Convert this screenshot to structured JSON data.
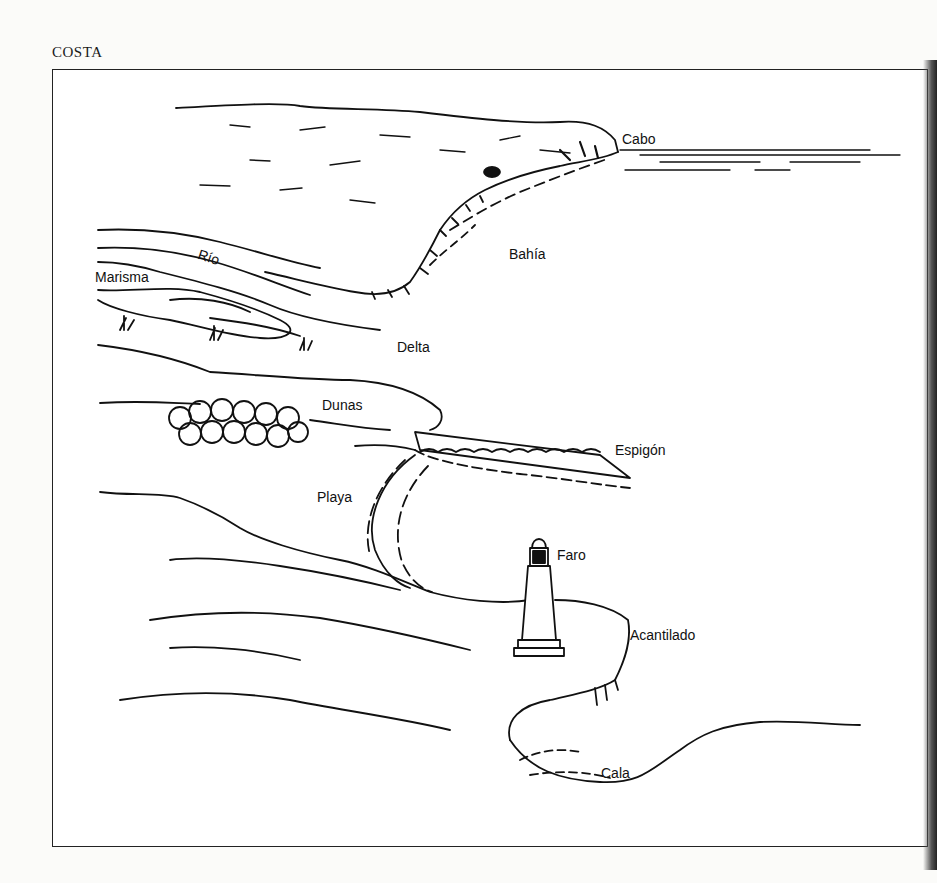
{
  "page": {
    "title": "COSTA"
  },
  "diagram": {
    "labels": [
      {
        "id": "cabo",
        "text": "Cabo",
        "x": 622,
        "y": 132
      },
      {
        "id": "bahia",
        "text": "Bahía",
        "x": 509,
        "y": 247
      },
      {
        "id": "rio",
        "text": "Río",
        "x": 198,
        "y": 250
      },
      {
        "id": "marisma",
        "text": "Marisma",
        "x": 95,
        "y": 270
      },
      {
        "id": "delta",
        "text": "Delta",
        "x": 397,
        "y": 340
      },
      {
        "id": "dunas",
        "text": "Dunas",
        "x": 322,
        "y": 398
      },
      {
        "id": "espigon",
        "text": "Espigón",
        "x": 615,
        "y": 443
      },
      {
        "id": "playa",
        "text": "Playa",
        "x": 317,
        "y": 490
      },
      {
        "id": "faro",
        "text": "Faro",
        "x": 557,
        "y": 548
      },
      {
        "id": "acantilado",
        "text": "Acantilado",
        "x": 630,
        "y": 628
      },
      {
        "id": "cala",
        "text": "Cala",
        "x": 601,
        "y": 766
      }
    ]
  },
  "colors": {
    "ink": "#111111",
    "paper": "#ffffff",
    "page": "#fbfbf9"
  }
}
